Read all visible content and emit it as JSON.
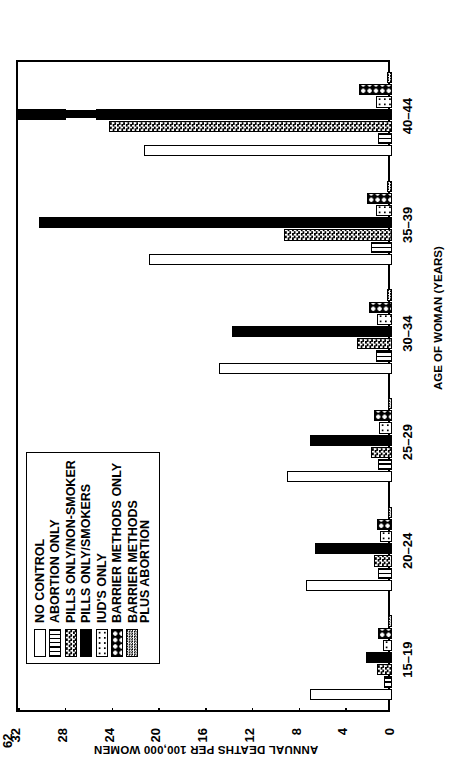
{
  "chart_data": {
    "type": "bar",
    "orientation": "vertical-grouped",
    "title": "",
    "xlabel": "AGE OF WOMAN (YEARS)",
    "ylabel": "ANNUAL DEATHS PER 100,000 WOMEN",
    "categories": [
      "15–19",
      "20–24",
      "25–29",
      "30–34",
      "35–39",
      "40–44"
    ],
    "ylim": [
      0,
      32
    ],
    "yticks": [
      0,
      4,
      8,
      12,
      16,
      20,
      24,
      28,
      32
    ],
    "ytick_labels": [
      "0",
      "4",
      "8",
      "12",
      "16",
      "20",
      "24",
      "28",
      "32"
    ],
    "grid": true,
    "grid_axis": "y",
    "legend_position": "inside-upper-left",
    "axis_break": {
      "present": true,
      "series": "PILLS ONLY/SMOKERS",
      "category": "40–44",
      "label": "62"
    },
    "series": [
      {
        "name": "NO CONTROL",
        "pattern": "none",
        "values": [
          7.0,
          7.4,
          9.0,
          14.8,
          20.8,
          21.2
        ]
      },
      {
        "name": "ABORTION ONLY",
        "pattern": "vline",
        "values": [
          0.7,
          1.2,
          1.2,
          1.4,
          1.8,
          1.2
        ]
      },
      {
        "name": "PILLS ONLY/NON-SMOKER",
        "pattern": "check",
        "values": [
          1.3,
          1.5,
          1.8,
          3.0,
          9.2,
          24.2
        ]
      },
      {
        "name": "PILLS ONLY/SMOKERS",
        "pattern": "solid",
        "values": [
          2.2,
          6.6,
          7.0,
          13.7,
          30.2,
          62.0
        ]
      },
      {
        "name": "IUD'S ONLY",
        "pattern": "circ",
        "values": [
          0.8,
          1.0,
          1.1,
          1.3,
          1.4,
          1.4
        ]
      },
      {
        "name": "BARRIER METHODS ONLY",
        "pattern": "bigdot",
        "values": [
          1.2,
          1.3,
          1.5,
          2.0,
          2.1,
          2.8
        ]
      },
      {
        "name": "BARRIER METHODS PLUS ABORTION",
        "pattern": "fine",
        "values": [
          0.3,
          0.3,
          0.3,
          0.4,
          0.4,
          0.4
        ]
      }
    ]
  },
  "legend": {
    "items": [
      {
        "label": "NO CONTROL",
        "line2": ""
      },
      {
        "label": "ABORTION ONLY",
        "line2": ""
      },
      {
        "label": "PILLS ONLY/NON-SMOKER",
        "line2": ""
      },
      {
        "label": "PILLS ONLY/SMOKERS",
        "line2": ""
      },
      {
        "label": "IUD'S ONLY",
        "line2": ""
      },
      {
        "label": "BARRIER METHODS ONLY",
        "line2": ""
      },
      {
        "label": "BARRIER METHODS",
        "line2": "PLUS ABORTION"
      }
    ]
  },
  "axes": {
    "y_title": "ANNUAL DEATHS PER 100,000 WOMEN",
    "x_title": "AGE OF WOMAN (YEARS)"
  },
  "annotations": {
    "break_value": "62"
  },
  "colors": {
    "ink": "#000000",
    "paper": "#ffffff"
  }
}
